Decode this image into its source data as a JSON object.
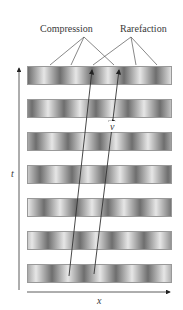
{
  "labels": {
    "compression": "Compression",
    "rarefaction": "Rarefaction",
    "velocity": "v",
    "time_axis": "t",
    "position_axis": "x"
  },
  "bands": [
    {
      "index": 1,
      "top": 66,
      "offset": 0
    },
    {
      "index": 2,
      "top": 99,
      "offset": 4
    },
    {
      "index": 3,
      "top": 132,
      "offset": 8
    },
    {
      "index": 4,
      "top": 165,
      "offset": 12
    },
    {
      "index": 5,
      "top": 198,
      "offset": 16
    },
    {
      "index": 6,
      "top": 231,
      "offset": 20
    },
    {
      "index": 7,
      "top": 264,
      "offset": 24
    }
  ],
  "colors": {
    "dark": "#6e6e6e",
    "light": "#e6e6e6",
    "line": "#333333"
  }
}
